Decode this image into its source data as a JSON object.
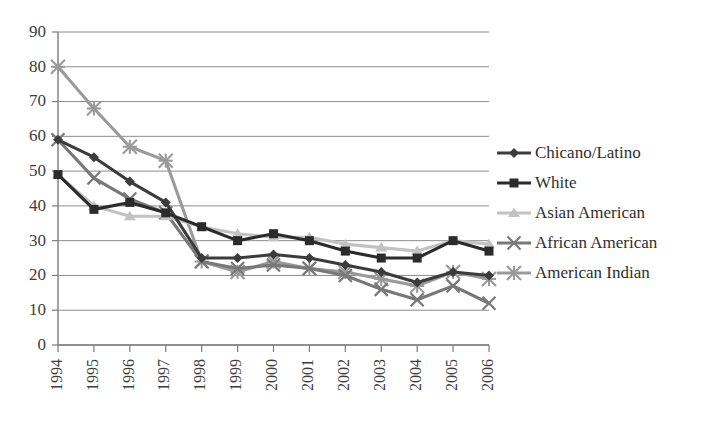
{
  "chart_data": {
    "type": "line",
    "title": "",
    "xlabel": "",
    "ylabel": "",
    "categories": [
      "1994",
      "1995",
      "1996",
      "1997",
      "1998",
      "1999",
      "2000",
      "2001",
      "2002",
      "2003",
      "2004",
      "2005",
      "2006"
    ],
    "ylim": [
      0,
      90
    ],
    "ytick_labels": [
      "0",
      "10",
      "20",
      "30",
      "40",
      "50",
      "60",
      "70",
      "80",
      "90"
    ],
    "ytick_values": [
      0,
      10,
      20,
      30,
      40,
      50,
      60,
      70,
      80,
      90
    ],
    "grid": true,
    "legend_position": "right",
    "series": [
      {
        "name": "Chicano/Latino",
        "color": "#3c3c3c",
        "marker": "diamond",
        "values": [
          59,
          54,
          47,
          41,
          25,
          25,
          26,
          25,
          23,
          21,
          18,
          21,
          20
        ]
      },
      {
        "name": "White",
        "color": "#2b2b2b",
        "marker": "square",
        "values": [
          49,
          39,
          41,
          38,
          34,
          30,
          32,
          30,
          27,
          25,
          25,
          30,
          27
        ]
      },
      {
        "name": "Asian American",
        "color": "#c2c2c2",
        "marker": "triangle",
        "values": [
          49,
          40,
          37,
          37,
          34,
          32,
          31,
          31,
          29,
          28,
          27,
          30,
          29
        ]
      },
      {
        "name": "African American",
        "color": "#787878",
        "marker": "cross",
        "values": [
          59,
          48,
          42,
          38,
          24,
          22,
          23,
          22,
          20,
          16,
          13,
          17,
          12
        ]
      },
      {
        "name": "American Indian",
        "color": "#9a9a9a",
        "marker": "asterisk",
        "values": [
          80,
          68,
          57,
          53,
          24,
          21,
          24,
          22,
          21,
          19,
          17,
          21,
          19
        ]
      }
    ]
  },
  "legend": {
    "items": [
      {
        "label": "Chicano/Latino"
      },
      {
        "label": "White"
      },
      {
        "label": "Asian American"
      },
      {
        "label": "African American"
      },
      {
        "label": "American Indian"
      }
    ]
  }
}
